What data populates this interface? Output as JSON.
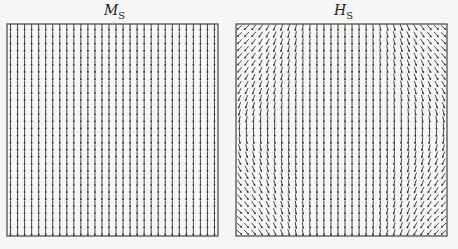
{
  "panels": [
    {
      "id": "Ms",
      "title_main": "M",
      "title_sub": "S",
      "box": {
        "x": 7,
        "y": 24,
        "w": 211,
        "h": 212
      },
      "field": "uniform-down"
    },
    {
      "id": "Hs",
      "title_main": "H",
      "title_sub": "S",
      "box": {
        "x": 7,
        "y": 24,
        "w": 211,
        "h": 212
      },
      "field": "demag-stray"
    }
  ],
  "grid": {
    "cols": 30,
    "rows": 30
  },
  "colors": {
    "line": "#333333",
    "border": "#444444",
    "background": "#f6f6f4"
  }
}
